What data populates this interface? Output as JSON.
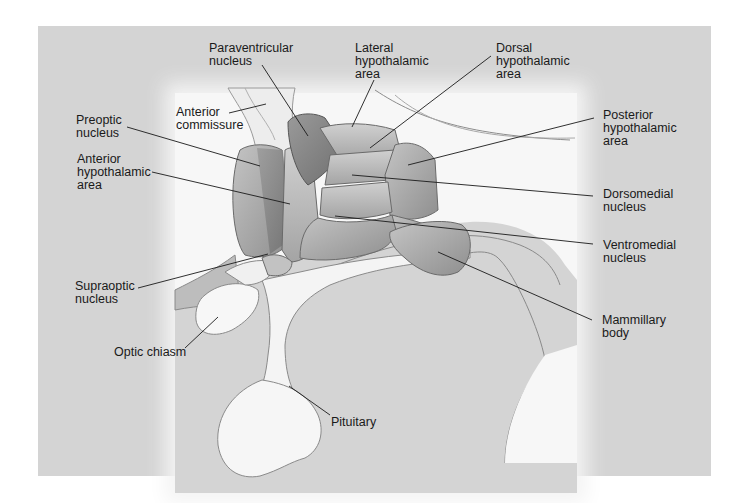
{
  "figure": {
    "colors": {
      "background": "#ffffff",
      "panel": "#d4d4d4",
      "glow": "#f7f7f7",
      "nucleus_fill": "#a8a8a8",
      "nucleus_dark": "#8a8a8a",
      "leader_line": "#1a1a1a"
    },
    "labels": {
      "paraventricular": "Paraventricular\nnucleus",
      "lateral": "Lateral\nhypothalamic\narea",
      "dorsal": "Dorsal\nhypothalamic\narea",
      "anterior_commissure": "Anterior\ncommissure",
      "preoptic": "Preoptic\nnucleus",
      "posterior": "Posterior\nhypothalamic\narea",
      "anterior_hypothalamic": "Anterior\nhypothalamic\narea",
      "dorsomedial": "Dorsomedial\nnucleus",
      "ventromedial": "Ventromedial\nnucleus",
      "supraoptic": "Supraoptic\nnucleus",
      "mammillary": "Mammillary\nbody",
      "optic_chiasm": "Optic chiasm",
      "pituitary": "Pituitary"
    }
  }
}
